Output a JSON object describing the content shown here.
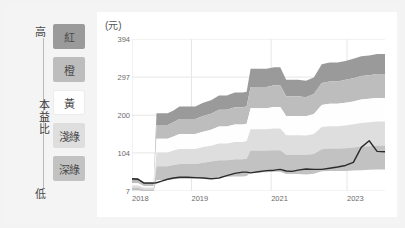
{
  "legend": {
    "axis_title": "本益比",
    "high_label": "高",
    "low_label": "低",
    "bands": [
      {
        "label": "紅",
        "color": "#9a9a9a"
      },
      {
        "label": "橙",
        "color": "#bdbdbd"
      },
      {
        "label": "黃",
        "color": "#fefefe"
      },
      {
        "label": "淺綠",
        "color": "#dedede"
      },
      {
        "label": "深綠",
        "color": "#c2c2c2"
      }
    ]
  },
  "chart_data": {
    "type": "area",
    "title": "",
    "subtitle": "",
    "unit_label": "(元)",
    "xlabel": "",
    "ylabel": "(元)",
    "grid": true,
    "legend_position": "left",
    "ylim": [
      7,
      394
    ],
    "yticks": [
      394,
      297,
      200,
      104,
      7
    ],
    "ytick_labels": [
      "394",
      "297",
      "200",
      "104",
      "7"
    ],
    "xlim": [
      "2018",
      "2024.5"
    ],
    "xticks": [
      "2018",
      "2019",
      "2021",
      "2023"
    ],
    "xtick_positions": [
      0.0,
      0.235,
      0.55,
      0.85
    ],
    "colors": {
      "band_red": "#9a9a9a",
      "band_orange": "#bdbdbd",
      "band_yellow": "#fefefe",
      "band_lightgreen": "#dedede",
      "band_darkgreen": "#c2c2c2",
      "price_line": "#2b2b2b",
      "gridline": "#e6e6e6",
      "plot_background": "#ffffff"
    },
    "x": [
      2018.0,
      2018.15,
      2018.3,
      2018.45,
      2018.55,
      2018.62,
      2018.75,
      2018.9,
      2019.05,
      2019.2,
      2019.4,
      2019.6,
      2019.8,
      2020.0,
      2020.2,
      2020.4,
      2020.6,
      2020.8,
      2020.9,
      2021.0,
      2021.2,
      2021.4,
      2021.6,
      2021.75,
      2021.9,
      2022.05,
      2022.2,
      2022.4,
      2022.6,
      2022.8,
      2023.0,
      2023.2,
      2023.4,
      2023.6,
      2023.8,
      2024.0,
      2024.2,
      2024.4
    ],
    "series": [
      {
        "name": "本益比上緣 (紅 上界)",
        "band": "red_top",
        "values": [
          40,
          40,
          30,
          30,
          30,
          205,
          205,
          205,
          212,
          222,
          222,
          222,
          232,
          238,
          250,
          250,
          258,
          258,
          260,
          318,
          318,
          318,
          322,
          322,
          290,
          290,
          290,
          288,
          296,
          330,
          334,
          334,
          338,
          344,
          350,
          352,
          356,
          356
        ]
      },
      {
        "name": "紅/橙 分界",
        "band": "red_bottom",
        "values": [
          33,
          33,
          25,
          25,
          25,
          175,
          175,
          175,
          182,
          190,
          190,
          190,
          198,
          204,
          214,
          214,
          220,
          220,
          222,
          272,
          272,
          272,
          276,
          276,
          248,
          248,
          248,
          246,
          254,
          282,
          286,
          286,
          290,
          294,
          300,
          302,
          305,
          305
        ]
      },
      {
        "name": "橙/黃 分界",
        "band": "orange_bottom",
        "values": [
          27,
          27,
          20,
          20,
          20,
          140,
          140,
          140,
          146,
          152,
          152,
          152,
          158,
          163,
          171,
          171,
          176,
          176,
          178,
          218,
          218,
          218,
          221,
          221,
          198,
          198,
          198,
          197,
          203,
          226,
          229,
          229,
          232,
          235,
          240,
          242,
          244,
          244
        ]
      },
      {
        "name": "黃/淺綠 分界",
        "band": "yellow_bottom",
        "values": [
          21,
          21,
          16,
          16,
          16,
          105,
          105,
          105,
          110,
          114,
          114,
          114,
          119,
          122,
          128,
          128,
          132,
          132,
          134,
          164,
          164,
          164,
          166,
          166,
          149,
          149,
          149,
          148,
          152,
          170,
          172,
          172,
          174,
          177,
          180,
          182,
          184,
          184
        ]
      },
      {
        "name": "淺綠/深綠 分界",
        "band": "lightgreen_bottom",
        "values": [
          15,
          15,
          11,
          11,
          11,
          70,
          70,
          70,
          73,
          76,
          76,
          76,
          79,
          82,
          85,
          85,
          88,
          88,
          89,
          110,
          110,
          110,
          111,
          111,
          99,
          99,
          99,
          99,
          101,
          113,
          115,
          115,
          116,
          118,
          120,
          121,
          123,
          123
        ]
      },
      {
        "name": "本益比下緣 (深綠 下界)",
        "band": "darkgreen_bottom",
        "values": [
          9,
          9,
          7,
          7,
          7,
          35,
          35,
          35,
          37,
          38,
          38,
          38,
          40,
          41,
          43,
          43,
          44,
          44,
          45,
          55,
          55,
          55,
          56,
          56,
          50,
          50,
          50,
          49,
          51,
          57,
          58,
          58,
          58,
          59,
          60,
          61,
          62,
          62
        ]
      },
      {
        "name": "股價",
        "band": "price_line",
        "values": [
          38,
          37,
          27,
          27,
          27,
          28,
          32,
          37,
          40,
          42,
          42,
          41,
          40,
          38,
          40,
          46,
          52,
          55,
          55,
          53,
          56,
          59,
          60,
          62,
          58,
          57,
          60,
          63,
          62,
          62,
          65,
          68,
          72,
          80,
          118,
          135,
          108,
          107
        ]
      }
    ],
    "annotations": []
  }
}
